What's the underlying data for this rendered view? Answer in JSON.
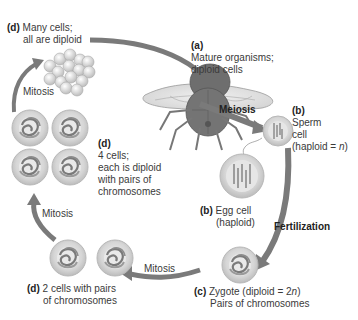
{
  "diagram": {
    "type": "life-cycle",
    "labels": {
      "many_cells": {
        "tag": "(d)",
        "line1": "Many  cells;",
        "line2": "all are diploid"
      },
      "mature": {
        "tag": "(a)",
        "line1": "Mature organisms;",
        "line2": "diploid cells"
      },
      "meiosis": "Meiosis",
      "sperm": {
        "tag": "(b)",
        "line1": "Sperm",
        "line2": "cell",
        "line3_pre": "(haploid = ",
        "line3_var": "n",
        "line3_post": ")"
      },
      "egg": {
        "tag": "(b)",
        "line1": "Egg cell",
        "line2": "(haploid)"
      },
      "fertilization": "Fertilization",
      "zygote": {
        "tag": "(c)",
        "line1_pre": "Zygote (diploid = 2",
        "line1_var": "n",
        "line1_post": ")",
        "line2": "Pairs of chromosomes"
      },
      "two_cells": {
        "tag": "(d)",
        "line1": "2 cells with pairs",
        "line2": "of chromosomes"
      },
      "four_cells": {
        "tag": "(d)",
        "line1": "4 cells;",
        "line2": "each is diploid",
        "line3": "with pairs of",
        "line4": "chromosomes"
      },
      "mitosis_bottom": "Mitosis",
      "mitosis_left": "Mitosis",
      "mitosis_top": "Mitosis"
    },
    "colors": {
      "arrow": "#707070",
      "cell_fill": "#d8d8d8",
      "cell_rim": "#bdbdbd",
      "fly_body": "#6e6e6e"
    }
  }
}
